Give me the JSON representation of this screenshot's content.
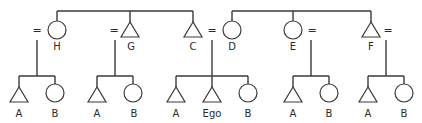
{
  "diagram": {
    "type": "kinship",
    "colors": {
      "line": "#3a3a3a",
      "text": "#2a2a2a",
      "background": "#ffffff"
    },
    "marriage_symbol": "=",
    "sibling_groups_top": [
      {
        "members": [
          "H",
          "G",
          "C"
        ]
      },
      {
        "members": [
          "D",
          "E",
          "F"
        ]
      }
    ],
    "top_row": [
      {
        "id": "H",
        "label": "H",
        "sex": "female",
        "shape": "circle"
      },
      {
        "id": "G",
        "label": "G",
        "sex": "male",
        "shape": "triangle"
      },
      {
        "id": "C",
        "label": "C",
        "sex": "male",
        "shape": "triangle"
      },
      {
        "id": "D",
        "label": "D",
        "sex": "female",
        "shape": "circle"
      },
      {
        "id": "E",
        "label": "E",
        "sex": "female",
        "shape": "circle"
      },
      {
        "id": "F",
        "label": "F",
        "sex": "male",
        "shape": "triangle"
      }
    ],
    "marriages": [
      {
        "spouse_of": "H",
        "position": "left"
      },
      {
        "spouse_of": "G",
        "position": "left"
      },
      {
        "spouses": [
          "C",
          "D"
        ]
      },
      {
        "spouse_of": "E",
        "position": "right"
      },
      {
        "spouse_of": "F",
        "position": "right"
      }
    ],
    "families": [
      {
        "parents": "H",
        "children": [
          {
            "label": "A",
            "shape": "triangle"
          },
          {
            "label": "B",
            "shape": "circle"
          }
        ]
      },
      {
        "parents": "G",
        "children": [
          {
            "label": "A",
            "shape": "triangle"
          },
          {
            "label": "B",
            "shape": "circle"
          }
        ]
      },
      {
        "parents": "C = D",
        "children": [
          {
            "label": "A",
            "shape": "triangle"
          },
          {
            "label": "Ego",
            "shape": "triangle"
          },
          {
            "label": "B",
            "shape": "circle"
          }
        ]
      },
      {
        "parents": "E",
        "children": [
          {
            "label": "A",
            "shape": "triangle"
          },
          {
            "label": "B",
            "shape": "circle"
          }
        ]
      },
      {
        "parents": "F",
        "children": [
          {
            "label": "A",
            "shape": "triangle"
          },
          {
            "label": "B",
            "shape": "circle"
          }
        ]
      }
    ]
  },
  "labels": {
    "H": "H",
    "G": "G",
    "C": "C",
    "D": "D",
    "E": "E",
    "F": "F",
    "eq": "=",
    "A": "A",
    "B": "B",
    "Ego": "Ego"
  }
}
